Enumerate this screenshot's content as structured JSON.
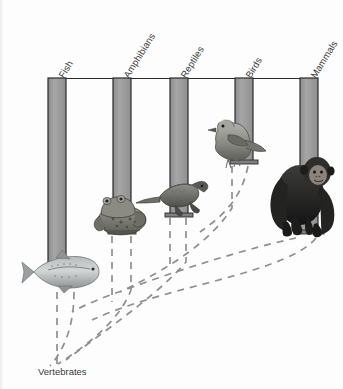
{
  "diagram": {
    "title_label": "Vertebrates",
    "type": "phylogenetic-ladder-diagram",
    "root": {
      "label": "Vertebrates",
      "x": 38,
      "y": 372
    },
    "colors": {
      "pillar_fill": "#9b9b9b",
      "pillar_stroke": "#2b2b2b",
      "dashed_line": "#8f8f8f",
      "text": "#3a3a3a",
      "background": "#fdfdfd"
    },
    "header_bar": {
      "x1": 48,
      "x2": 318,
      "y": 78
    },
    "columns": [
      {
        "label": "Fish",
        "icon": "fish-icon",
        "x": 48,
        "width": 18,
        "top": 78,
        "bottom": 278,
        "label_x": 62,
        "label_y": 73
      },
      {
        "label": "Amphibians",
        "icon": "frog-icon",
        "x": 113,
        "width": 18,
        "top": 78,
        "bottom": 232,
        "label_x": 127,
        "label_y": 73
      },
      {
        "label": "Reptiles",
        "icon": "lizard-icon",
        "x": 170,
        "width": 18,
        "top": 78,
        "bottom": 216,
        "label_x": 184,
        "label_y": 73
      },
      {
        "label": "Birds",
        "icon": "bird-icon",
        "x": 235,
        "width": 18,
        "top": 78,
        "bottom": 163,
        "label_x": 249,
        "label_y": 73
      },
      {
        "label": "Mammals",
        "icon": "chimpanzee-icon",
        "x": 300,
        "width": 18,
        "top": 78,
        "bottom": 233,
        "label_x": 314,
        "label_y": 73
      }
    ],
    "animals": [
      {
        "name": "fish-icon",
        "caption": "Fish",
        "x": 22,
        "y": 253,
        "w": 78,
        "h": 40
      },
      {
        "name": "frog-icon",
        "caption": "Amphibians",
        "x": 96,
        "y": 192,
        "w": 52,
        "h": 45
      },
      {
        "name": "lizard-icon",
        "caption": "Reptiles",
        "x": 144,
        "y": 178,
        "w": 62,
        "h": 40
      },
      {
        "name": "bird-icon",
        "caption": "Birds",
        "x": 201,
        "y": 118,
        "w": 66,
        "h": 48
      },
      {
        "name": "chimpanzee-icon",
        "caption": "Mammals",
        "x": 258,
        "y": 152,
        "w": 84,
        "h": 85
      }
    ]
  }
}
